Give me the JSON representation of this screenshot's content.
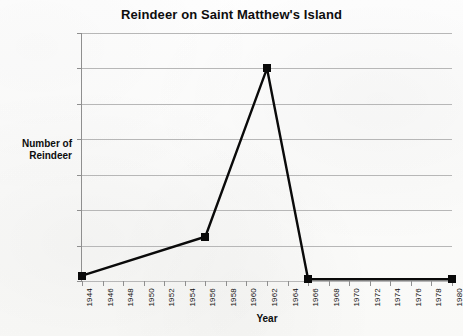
{
  "chart_data": {
    "type": "line",
    "title": "Reindeer on Saint Matthew's Island",
    "xlabel": "Year",
    "ylabel": "Number of Reindeer",
    "ylabel_lines": [
      "Number of",
      "Reindeer"
    ],
    "x": [
      1944,
      1956,
      1962,
      1966,
      1980
    ],
    "values": [
      150,
      1250,
      6000,
      50,
      50
    ],
    "series": [
      {
        "name": "Reindeer population",
        "x": [
          1944,
          1956,
          1962,
          1966,
          1980
        ],
        "values": [
          150,
          1250,
          6000,
          50,
          50
        ]
      }
    ],
    "xlim": [
      1944,
      1980
    ],
    "ylim": [
      0,
      7000
    ],
    "xticks": [
      1944,
      1946,
      1948,
      1950,
      1952,
      1954,
      1956,
      1958,
      1960,
      1962,
      1964,
      1966,
      1968,
      1970,
      1972,
      1974,
      1976,
      1978,
      1980
    ],
    "xtick_labels": [
      "1944",
      "1946",
      "1948",
      "1950",
      "1952",
      "1954",
      "1956",
      "1958",
      "1960",
      "1962",
      "1964",
      "1966",
      "1968",
      "1970",
      "1972",
      "1974",
      "1976",
      "1978",
      "1980"
    ],
    "yticks": [
      0,
      1000,
      2000,
      3000,
      4000,
      5000,
      6000,
      7000
    ],
    "ytick_labels": [
      "0",
      "1000",
      "2000",
      "3000",
      "4000",
      "5000",
      "6000",
      "7000"
    ],
    "grid": true,
    "grid_axis": "y",
    "legend": false,
    "legend_position": "none",
    "marker": "square",
    "line_color": "#0a0a0a",
    "marker_color": "#0a0a0a",
    "grid_color": "#b7b7b7",
    "background_color": "#fdfdfc",
    "text_color": "#0d0d0d"
  }
}
